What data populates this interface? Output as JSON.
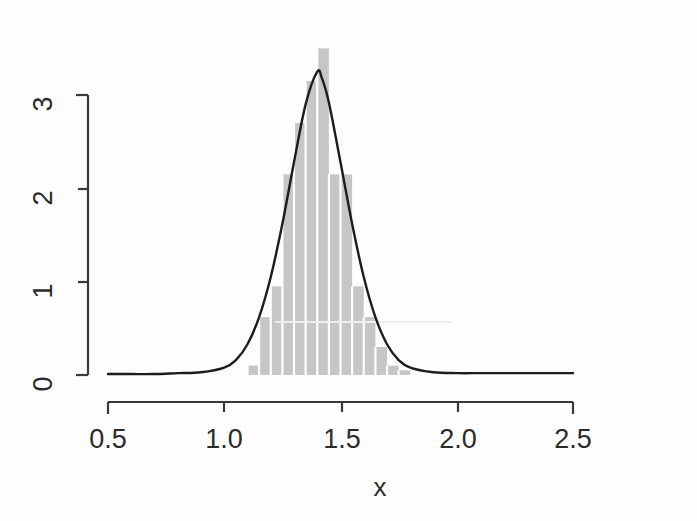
{
  "chart_data": {
    "type": "bar",
    "title": "",
    "subtitle": "",
    "xlabel": "x",
    "ylabel": "",
    "xlim": [
      0.5,
      2.5
    ],
    "ylim": [
      0,
      3.5
    ],
    "xticks": [
      "0.5",
      "1.0",
      "1.5",
      "2.0",
      "2.5"
    ],
    "xtick_values": [
      0.5,
      1.0,
      1.5,
      2.0,
      2.5
    ],
    "yticks": [
      "0",
      "1",
      "2",
      "3"
    ],
    "ytick_values": [
      0,
      1,
      2,
      3
    ],
    "grid": false,
    "legend": null,
    "bar_color": "#c6c6c6",
    "curve_color": "#1c1c1c",
    "bin_width": 0.1,
    "categories": [
      1.1,
      1.15,
      1.2,
      1.25,
      1.3,
      1.35,
      1.4,
      1.45,
      1.5,
      1.55,
      1.6,
      1.65,
      1.7,
      1.75
    ],
    "bin_edges": [
      1.1,
      1.15,
      1.2,
      1.25,
      1.3,
      1.35,
      1.4,
      1.45,
      1.5,
      1.55,
      1.6,
      1.65,
      1.7,
      1.75,
      1.8
    ],
    "values": [
      0.1,
      0.62,
      0.95,
      2.15,
      2.7,
      3.15,
      3.5,
      2.15,
      2.15,
      0.95,
      0.62,
      0.3,
      0.1,
      0.05
    ],
    "series": [
      {
        "name": "histogram-density",
        "type": "bar",
        "values": [
          0.1,
          0.62,
          0.95,
          2.15,
          2.7,
          3.15,
          3.5,
          2.15,
          2.15,
          0.95,
          0.62,
          0.3,
          0.1,
          0.05
        ]
      },
      {
        "name": "density-curve",
        "type": "line",
        "x": [
          0.5,
          0.6,
          0.7,
          0.8,
          0.9,
          1.0,
          1.05,
          1.1,
          1.15,
          1.2,
          1.25,
          1.3,
          1.35,
          1.4,
          1.42,
          1.45,
          1.5,
          1.55,
          1.6,
          1.65,
          1.7,
          1.75,
          1.8,
          1.9,
          2.0,
          2.1,
          2.2,
          2.3,
          2.4,
          2.5
        ],
        "y": [
          0.01,
          0.01,
          0.01,
          0.02,
          0.03,
          0.08,
          0.16,
          0.33,
          0.62,
          1.05,
          1.62,
          2.28,
          2.9,
          3.25,
          3.18,
          2.92,
          2.28,
          1.62,
          1.05,
          0.62,
          0.33,
          0.16,
          0.08,
          0.03,
          0.02,
          0.02,
          0.02,
          0.02,
          0.02,
          0.02
        ]
      }
    ],
    "peak": {
      "x": 1.4,
      "y": 3.25
    },
    "annotations": []
  },
  "axes": {
    "x_title": "x",
    "y_title": ""
  }
}
